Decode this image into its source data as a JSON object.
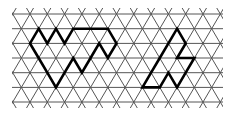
{
  "figure": {
    "background_color": "#ffffff",
    "grid_color": "#555555",
    "outline_color": "#000000"
  },
  "grid": {
    "type": "triangular",
    "rows": 7,
    "row_y": [
      14,
      28.7,
      43.4,
      58,
      72.7,
      87.4,
      102
    ],
    "x_min": 12,
    "x_max": 223,
    "clip_top": 8,
    "clip_bottom": 108,
    "first_top_vertex_x": 30,
    "side": 17.3,
    "row_height": 14.68
  },
  "shapes": [
    {
      "name": "left-shape",
      "points_lattice": [
        [
          38.65,
          28.7
        ],
        [
          47.3,
          43.4
        ],
        [
          55.95,
          28.7
        ],
        [
          64.6,
          43.4
        ],
        [
          73.25,
          28.7
        ],
        [
          107.85,
          28.7
        ],
        [
          116.5,
          43.4
        ],
        [
          107.85,
          58
        ],
        [
          99.2,
          43.4
        ],
        [
          90.55,
          58
        ],
        [
          81.9,
          72.7
        ],
        [
          73.25,
          58
        ],
        [
          64.6,
          72.7
        ],
        [
          55.95,
          87.4
        ],
        [
          47.3,
          72.7
        ],
        [
          38.65,
          58
        ],
        [
          30,
          43.4
        ]
      ]
    },
    {
      "name": "right-shape",
      "points_lattice": [
        [
          177.05,
          28.7
        ],
        [
          185.7,
          43.4
        ],
        [
          177.05,
          58
        ],
        [
          194.35,
          58
        ],
        [
          185.7,
          72.7
        ],
        [
          177.05,
          87.4
        ],
        [
          168.4,
          72.7
        ],
        [
          159.75,
          87.4
        ],
        [
          142.45,
          87.4
        ],
        [
          151.1,
          72.7
        ],
        [
          159.75,
          58
        ],
        [
          168.4,
          43.4
        ]
      ]
    }
  ]
}
